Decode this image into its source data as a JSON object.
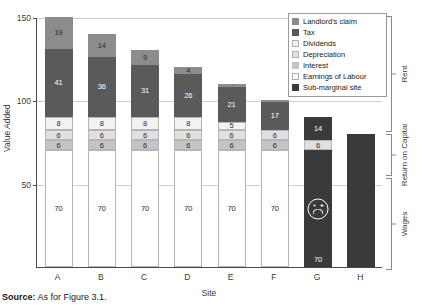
{
  "figure": {
    "source_prefix": "Source:",
    "source_text": "As for Figure 3.1."
  },
  "legend": {
    "items": [
      {
        "label": "Landlord's claim",
        "color": "#8c8c8c"
      },
      {
        "label": "Tax",
        "color": "#5a5a5a"
      },
      {
        "label": "Dividends",
        "color": "#f2f2f2"
      },
      {
        "label": "Depreciation",
        "color": "#e0e0e0"
      },
      {
        "label": "Interest",
        "color": "#c4c4c4"
      },
      {
        "label": "Earnings of Labour",
        "color": "#ffffff"
      },
      {
        "label": "Sub-marginal site",
        "color": "#3a3a3a"
      }
    ]
  },
  "brackets": [
    {
      "label": "Rent"
    },
    {
      "label": "Return on Capital"
    },
    {
      "label": "Wages"
    }
  ],
  "chart_data": {
    "type": "bar",
    "title": "",
    "subtitle": "",
    "xlabel": "Site",
    "ylabel": "Value Added",
    "ylim": [
      0,
      150
    ],
    "yticks": [
      50,
      100,
      150
    ],
    "grid": true,
    "legend_position": "top-right",
    "stacked": true,
    "categories": [
      "A",
      "B",
      "C",
      "D",
      "E",
      "F",
      "G",
      "H"
    ],
    "series": [
      {
        "name": "Earnings of Labour",
        "color": "#ffffff",
        "values": [
          70,
          70,
          70,
          70,
          70,
          70,
          70,
          0
        ]
      },
      {
        "name": "Interest",
        "color": "#c4c4c4",
        "values": [
          6,
          6,
          6,
          6,
          6,
          6,
          0,
          0
        ]
      },
      {
        "name": "Depreciation",
        "color": "#e0e0e0",
        "values": [
          6,
          6,
          6,
          6,
          6,
          6,
          6,
          0
        ]
      },
      {
        "name": "Dividends",
        "color": "#f2f2f2",
        "values": [
          8,
          8,
          8,
          8,
          5,
          0,
          0,
          0
        ]
      },
      {
        "name": "Tax",
        "color": "#5a5a5a",
        "values": [
          41,
          36,
          31,
          26,
          21,
          17,
          14,
          0
        ]
      },
      {
        "name": "Landlord's claim",
        "color": "#8c8c8c",
        "values": [
          19,
          14,
          9,
          4,
          2,
          1,
          0,
          0
        ]
      },
      {
        "name": "Sub-marginal site",
        "color": "#3a3a3a",
        "values": [
          0,
          0,
          0,
          0,
          0,
          0,
          0,
          80
        ]
      }
    ],
    "totals": [
      150,
      140,
      130,
      120,
      110,
      100,
      90,
      80
    ],
    "annotations": [
      {
        "category": "G",
        "marker": "sad-face-icon",
        "note": "Sub-marginal site indicator"
      }
    ]
  }
}
